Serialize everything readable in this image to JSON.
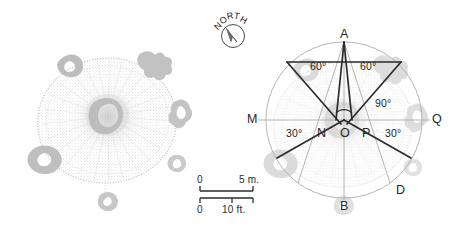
{
  "figure": {
    "panels": [
      {
        "id": "left",
        "name": "plan-only",
        "caption": ""
      },
      {
        "id": "right",
        "name": "plan-with-geometry",
        "caption": ""
      }
    ]
  },
  "compass": {
    "label": "NORTH",
    "letters": [
      "N",
      "O",
      "R",
      "T",
      "H"
    ],
    "needle_bearing_deg": 330,
    "icon": "compass-rose-icon"
  },
  "scalebars": [
    {
      "id": "metric",
      "start": "0",
      "end": "5 m.",
      "unit": "m",
      "length_value": 5
    },
    {
      "id": "imperial",
      "start": "0",
      "end": "10 ft.",
      "unit": "ft",
      "length_value": 10
    }
  ],
  "geometry": {
    "points": [
      {
        "label": "A",
        "name": "point-a",
        "position": "top-apex"
      },
      {
        "label": "B",
        "name": "point-b",
        "position": "bottom"
      },
      {
        "label": "D",
        "name": "point-d",
        "position": "bottom-right"
      },
      {
        "label": "M",
        "name": "point-m",
        "position": "left-end"
      },
      {
        "label": "N",
        "name": "point-n",
        "position": "left-of-center"
      },
      {
        "label": "O",
        "name": "point-o",
        "position": "center"
      },
      {
        "label": "P",
        "name": "point-p",
        "position": "right-of-center"
      },
      {
        "label": "Q",
        "name": "point-q",
        "position": "right-end"
      }
    ],
    "angles": [
      {
        "label": "60°",
        "name": "angle-60-left",
        "value": 60
      },
      {
        "label": "60°",
        "name": "angle-60-right",
        "value": 60
      },
      {
        "label": "90°",
        "name": "angle-90-center",
        "value": 90
      },
      {
        "label": "30°",
        "name": "angle-30-left",
        "value": 30
      },
      {
        "label": "30°",
        "name": "angle-30-right",
        "value": 30
      }
    ]
  },
  "colors": {
    "construction_line": "#2b2b2b",
    "thin_line": "#9a9a9a",
    "circle_outline": "#b0b0b0",
    "plan_stipple": "#c9c9c9",
    "plan_blob": "#c0c0c0",
    "background": "#ffffff"
  }
}
